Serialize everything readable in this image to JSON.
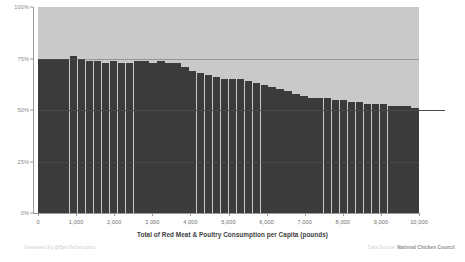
{
  "chart_data": {
    "type": "bar",
    "title": "",
    "subtitle": "",
    "xlabel": "Total of Red Meat & Poultry Consumption per Capita (pounds)",
    "ylabel": "",
    "stacked": "100%",
    "grid": true,
    "legend_position": "none",
    "xlim": [
      0,
      10000
    ],
    "ylim": [
      0,
      100
    ],
    "x_ticks": [
      "0",
      "1,000",
      "2,000",
      "3,000",
      "4,000",
      "5,000",
      "6,000",
      "7,000",
      "8,000",
      "9,000",
      "10,000"
    ],
    "x_tick_values": [
      0,
      1000,
      2000,
      3000,
      4000,
      5000,
      6000,
      7000,
      8000,
      9000,
      10000
    ],
    "y_ticks": [
      "0%",
      "25%",
      "50%",
      "75%",
      "100%"
    ],
    "y_tick_values": [
      0,
      25,
      50,
      75,
      100
    ],
    "reference_line": 50,
    "colors": {
      "lower_segment": "#3b3b3b",
      "upper_segment": "#c9c9c9",
      "axis": "#9a9a9a",
      "grid": "#5a5a5a",
      "tick_label": "#8a8a8a",
      "axis_title": "#3d3d3d"
    },
    "series": [
      {
        "name": "Red Meat share",
        "color": "#3b3b3b",
        "values": [
          75,
          75,
          75,
          75,
          76,
          75,
          74,
          74,
          73,
          74,
          73,
          73,
          74,
          74,
          73,
          74,
          73,
          73,
          71,
          69,
          68,
          67,
          66,
          65,
          65,
          65,
          64,
          63,
          62,
          61,
          60,
          59,
          58,
          57,
          56,
          56,
          56,
          55,
          55,
          54,
          54,
          53,
          53,
          53,
          52,
          52,
          52,
          51
        ]
      },
      {
        "name": "Poultry share",
        "color": "#c9c9c9",
        "values": [
          25,
          25,
          25,
          25,
          24,
          25,
          26,
          26,
          27,
          26,
          27,
          27,
          26,
          26,
          27,
          26,
          27,
          27,
          29,
          31,
          32,
          33,
          34,
          35,
          35,
          35,
          36,
          37,
          38,
          39,
          40,
          41,
          42,
          43,
          44,
          44,
          44,
          45,
          45,
          46,
          46,
          47,
          47,
          47,
          48,
          48,
          48,
          49
        ]
      }
    ]
  },
  "footer": {
    "credit_left": "Generated by @BamTechnication",
    "source_label": "Data Source:",
    "source_value": "National Chicken Council"
  }
}
